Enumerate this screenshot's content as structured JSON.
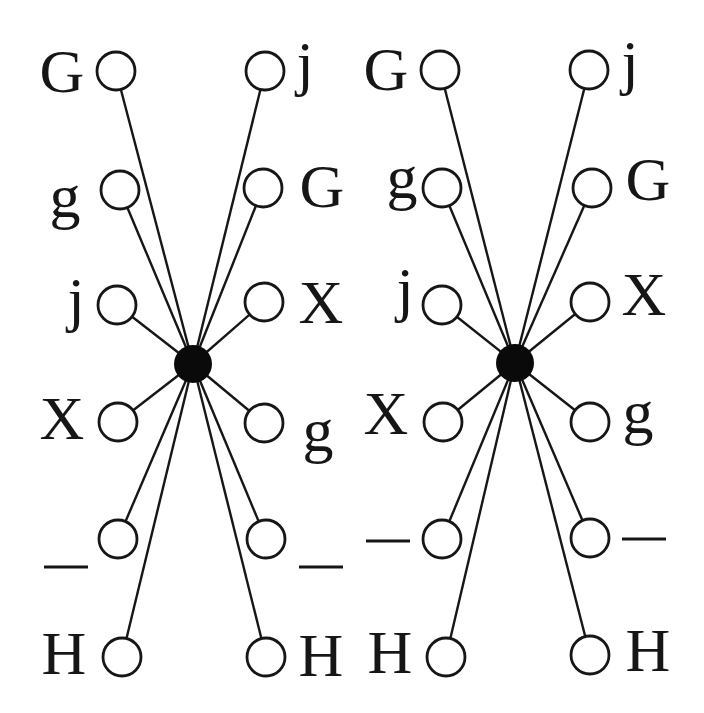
{
  "diagram": {
    "background_color": "#ffffff",
    "stroke_color": "#161616",
    "center_fill_color": "#0a0a0a",
    "node_fill_color": "#ffffff",
    "node_radius": 19,
    "center_radius": 19,
    "circle_stroke_width": 2.8,
    "edge_stroke_width": 2.4,
    "dash_half_length": 22,
    "dash_stroke_width": 3,
    "label_font_size": 62,
    "graphs": [
      {
        "name": "left-graph",
        "center": {
          "x": 193,
          "y": 364
        },
        "nodes": [
          {
            "label": "G",
            "cx": 116,
            "cy": 71,
            "lx": 62,
            "ly": 71
          },
          {
            "label": "j",
            "cx": 265,
            "cy": 71,
            "lx": 305,
            "ly": 63
          },
          {
            "label": "g",
            "cx": 120,
            "cy": 190,
            "lx": 65,
            "ly": 196
          },
          {
            "label": "G",
            "cx": 263,
            "cy": 188,
            "lx": 322,
            "ly": 186
          },
          {
            "label": "j",
            "cx": 117,
            "cy": 305,
            "lx": 76,
            "ly": 299
          },
          {
            "label": "X",
            "cx": 264,
            "cy": 302,
            "lx": 321,
            "ly": 302
          },
          {
            "label": "X",
            "cx": 118,
            "cy": 422,
            "lx": 62,
            "ly": 418
          },
          {
            "label": "g",
            "cx": 264,
            "cy": 423,
            "lx": 318,
            "ly": 430
          },
          {
            "label": "—",
            "cx": 118,
            "cy": 539,
            "lx": 66,
            "ly": 567
          },
          {
            "label": "—",
            "cx": 266,
            "cy": 539,
            "lx": 321,
            "ly": 567
          },
          {
            "label": "H",
            "cx": 122,
            "cy": 657,
            "lx": 64,
            "ly": 653
          },
          {
            "label": "H",
            "cx": 266,
            "cy": 657,
            "lx": 321,
            "ly": 655
          }
        ]
      },
      {
        "name": "right-graph",
        "center": {
          "x": 515,
          "y": 363
        },
        "nodes": [
          {
            "label": "G",
            "cx": 440,
            "cy": 70,
            "lx": 386,
            "ly": 69
          },
          {
            "label": "j",
            "cx": 589,
            "cy": 70,
            "lx": 630,
            "ly": 62
          },
          {
            "label": "g",
            "cx": 442,
            "cy": 188,
            "lx": 402,
            "ly": 177
          },
          {
            "label": "G",
            "cx": 592,
            "cy": 188,
            "lx": 648,
            "ly": 179
          },
          {
            "label": "j",
            "cx": 442,
            "cy": 305,
            "lx": 405,
            "ly": 289
          },
          {
            "label": "X",
            "cx": 590,
            "cy": 302,
            "lx": 644,
            "ly": 294
          },
          {
            "label": "X",
            "cx": 443,
            "cy": 422,
            "lx": 386,
            "ly": 413
          },
          {
            "label": "g",
            "cx": 590,
            "cy": 422,
            "lx": 638,
            "ly": 412
          },
          {
            "label": "—",
            "cx": 442,
            "cy": 539,
            "lx": 388,
            "ly": 541
          },
          {
            "label": "—",
            "cx": 590,
            "cy": 538,
            "lx": 644,
            "ly": 539
          },
          {
            "label": "H",
            "cx": 446,
            "cy": 657,
            "lx": 390,
            "ly": 652
          },
          {
            "label": "H",
            "cx": 590,
            "cy": 655,
            "lx": 648,
            "ly": 650
          }
        ]
      }
    ]
  }
}
